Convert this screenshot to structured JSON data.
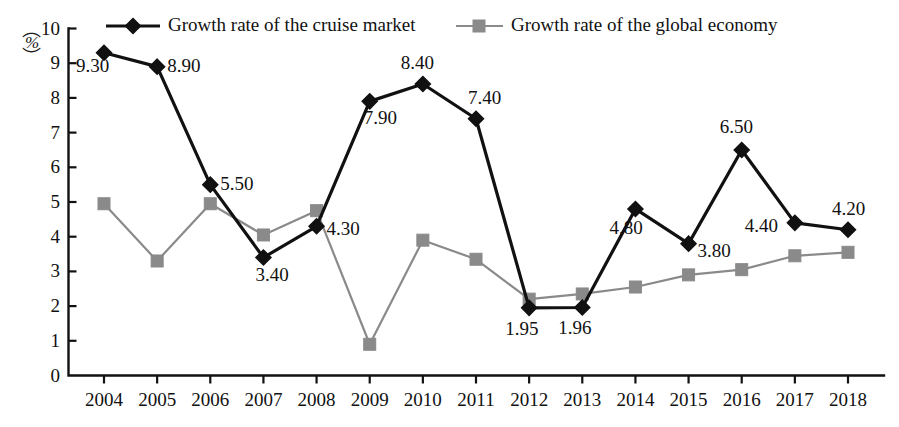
{
  "chart_data": {
    "type": "line",
    "title": "",
    "xlabel": "",
    "ylabel": "%",
    "ylim": [
      0,
      10
    ],
    "xlim": [
      2004,
      2018
    ],
    "grid": false,
    "legend_position": "top",
    "y_ticks": [
      "10",
      "9",
      "8",
      "7",
      "6",
      "5",
      "4",
      "3",
      "2",
      "1",
      "0"
    ],
    "categories": [
      "2004",
      "2005",
      "2006",
      "2007",
      "2008",
      "2009",
      "2010",
      "2011",
      "2012",
      "2013",
      "2014",
      "2015",
      "2016",
      "2017",
      "2018"
    ],
    "series": [
      {
        "name": "Growth rate of the cruise market",
        "color": "#111111",
        "marker": "diamond",
        "values": [
          9.3,
          8.9,
          5.5,
          3.4,
          4.3,
          7.9,
          8.4,
          7.4,
          1.95,
          1.96,
          4.8,
          3.8,
          6.5,
          4.4,
          4.2
        ],
        "labels": [
          "9.30",
          "8.90",
          "5.50",
          "3.40",
          "4.30",
          "7.90",
          "8.40",
          "7.40",
          "1.95",
          "1.96",
          "4.80",
          "3.80",
          "6.50",
          "4.40",
          "4.20"
        ]
      },
      {
        "name": "Growth rate of the global economy",
        "color": "#8a8a8a",
        "marker": "square",
        "values": [
          4.95,
          3.3,
          4.95,
          4.05,
          4.75,
          0.9,
          3.9,
          3.35,
          2.2,
          2.35,
          2.55,
          2.9,
          3.05,
          3.45,
          3.55
        ],
        "labels": [
          "",
          "",
          "",
          "",
          "",
          "",
          "",
          "",
          "",
          "",
          "",
          "",
          "",
          "",
          ""
        ]
      }
    ]
  },
  "legend": {
    "items": [
      {
        "label": "Growth rate of the cruise market",
        "color": "#111111",
        "marker": "diamond"
      },
      {
        "label": "Growth rate of the global economy",
        "color": "#8a8a8a",
        "marker": "square"
      }
    ]
  },
  "axis": {
    "unit_symbol": "%",
    "unit_open_paren": "︵",
    "unit_close_paren": "︶"
  }
}
